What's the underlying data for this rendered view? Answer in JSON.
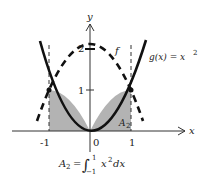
{
  "diagram": {
    "axes": {
      "x_label": "x",
      "y_label": "y",
      "x_ticks": [
        "-1",
        "0",
        "1"
      ],
      "y_ticks": [
        "1",
        "2"
      ]
    },
    "curves": {
      "g_label": "g(x) = x",
      "g_exponent": "2",
      "f_label": "f"
    },
    "region": {
      "label": "A",
      "label_sub": "2",
      "fill_color": "#b3b3b3"
    },
    "formula": {
      "lhs": "A",
      "lhs_sub": "2",
      "eq": "=",
      "integral": "∫",
      "upper": "1",
      "lower": "−1",
      "integrand": "x",
      "integrand_exp": "2",
      "dx": "dx"
    }
  }
}
